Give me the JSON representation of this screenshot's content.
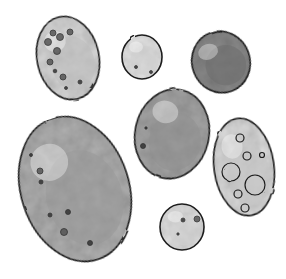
{
  "scene": {
    "description": "Watercolor ink illustration of seven pebbles/eggs on white background",
    "background": "#ffffff",
    "outline_color": "#1e1e1e"
  },
  "stones": [
    {
      "name": "speckled-oval-top-left",
      "cx": 68,
      "cy": 58,
      "rx": 31,
      "ry": 42,
      "rotate": -12,
      "fill": "#d8d8d8",
      "shade": "#bdbdbd"
    },
    {
      "name": "small-pale-circle",
      "cx": 142,
      "cy": 57,
      "rx": 20,
      "ry": 22,
      "rotate": 0,
      "fill": "#e4e4e4",
      "shade": "#d0d0d0"
    },
    {
      "name": "dark-oval-top-right",
      "cx": 221,
      "cy": 62,
      "rx": 29,
      "ry": 31,
      "rotate": -20,
      "fill": "#8a8a8a",
      "shade": "#6e6e6e"
    },
    {
      "name": "large-oval-bottom-left",
      "cx": 75,
      "cy": 189,
      "rx": 54,
      "ry": 74,
      "rotate": -18,
      "fill": "#b0b0b0",
      "shade": "#999999"
    },
    {
      "name": "mid-gray-oval",
      "cx": 172,
      "cy": 134,
      "rx": 37,
      "ry": 45,
      "rotate": 12,
      "fill": "#a6a6a6",
      "shade": "#8f8f8f"
    },
    {
      "name": "spotted-oval-right",
      "cx": 244,
      "cy": 167,
      "rx": 30,
      "ry": 49,
      "rotate": -8,
      "fill": "#dcdcdc",
      "shade": "#c4c4c4"
    },
    {
      "name": "small-circle-bottom",
      "cx": 182,
      "cy": 227,
      "rx": 22,
      "ry": 23,
      "rotate": 0,
      "fill": "#e2e2e2",
      "shade": "#cfcfcf"
    }
  ],
  "speckles": [
    {
      "stone": 0,
      "cx": 53,
      "cy": 33,
      "r": 3
    },
    {
      "stone": 0,
      "cx": 60,
      "cy": 37,
      "r": 3.5
    },
    {
      "stone": 0,
      "cx": 70,
      "cy": 32,
      "r": 3
    },
    {
      "stone": 0,
      "cx": 48,
      "cy": 42,
      "r": 3.5
    },
    {
      "stone": 0,
      "cx": 57,
      "cy": 51,
      "r": 3.5
    },
    {
      "stone": 0,
      "cx": 50,
      "cy": 62,
      "r": 3
    },
    {
      "stone": 0,
      "cx": 63,
      "cy": 77,
      "r": 3
    },
    {
      "stone": 0,
      "cx": 80,
      "cy": 82,
      "r": 2
    },
    {
      "stone": 0,
      "cx": 55,
      "cy": 71,
      "r": 1.8
    },
    {
      "stone": 0,
      "cx": 66,
      "cy": 88,
      "r": 1.5
    },
    {
      "stone": 3,
      "cx": 40,
      "cy": 171,
      "r": 3
    },
    {
      "stone": 3,
      "cx": 41,
      "cy": 182,
      "r": 2
    },
    {
      "stone": 3,
      "cx": 68,
      "cy": 212,
      "r": 2.5
    },
    {
      "stone": 3,
      "cx": 64,
      "cy": 232,
      "r": 3.5
    },
    {
      "stone": 3,
      "cx": 90,
      "cy": 243,
      "r": 2.5
    },
    {
      "stone": 3,
      "cx": 50,
      "cy": 215,
      "r": 2
    },
    {
      "stone": 3,
      "cx": 31,
      "cy": 155,
      "r": 1.5
    },
    {
      "stone": 4,
      "cx": 143,
      "cy": 146,
      "r": 2.5
    },
    {
      "stone": 4,
      "cx": 146,
      "cy": 128,
      "r": 1.2
    },
    {
      "stone": 6,
      "cx": 183,
      "cy": 220,
      "r": 2
    },
    {
      "stone": 6,
      "cx": 197,
      "cy": 219,
      "r": 3
    },
    {
      "stone": 6,
      "cx": 178,
      "cy": 234,
      "r": 1.2
    },
    {
      "stone": 1,
      "cx": 136,
      "cy": 67,
      "r": 1.5
    },
    {
      "stone": 1,
      "cx": 151,
      "cy": 72,
      "r": 1.5
    }
  ],
  "rings": [
    {
      "stone": 5,
      "cx": 231,
      "cy": 172,
      "r": 9
    },
    {
      "stone": 5,
      "cx": 255,
      "cy": 185,
      "r": 10
    },
    {
      "stone": 5,
      "cx": 247,
      "cy": 156,
      "r": 4
    },
    {
      "stone": 5,
      "cx": 238,
      "cy": 194,
      "r": 4
    },
    {
      "stone": 5,
      "cx": 240,
      "cy": 138,
      "r": 4
    },
    {
      "stone": 5,
      "cx": 262,
      "cy": 155,
      "r": 2.5
    },
    {
      "stone": 5,
      "cx": 245,
      "cy": 208,
      "r": 4
    }
  ]
}
